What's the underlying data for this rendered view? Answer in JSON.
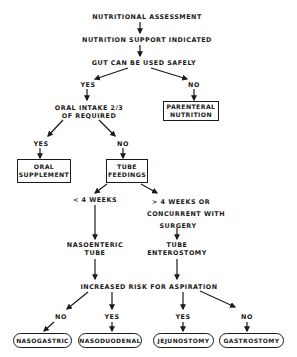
{
  "diagram": {
    "type": "flowchart",
    "title": "Nutritional Assessment",
    "nodes": {
      "assessment": "NUTRITIONAL ASSESSMENT",
      "support": "NUTRITION SUPPORT INDICATED",
      "gut": "GUT CAN BE USED SAFELY",
      "gut_yes": "YES",
      "gut_no": "NO",
      "oral_intake_line1": "ORAL INTAKE 2/3",
      "oral_intake_line2": "OF REQUIRED",
      "parenteral_line1": "PARENTERAL",
      "parenteral_line2": "NUTRITION",
      "oral_yes": "YES",
      "oral_no": "NO",
      "oral_supplement_line1": "ORAL",
      "oral_supplement_line2": "SUPPLEMENT",
      "tube_feedings_line1": "TUBE",
      "tube_feedings_line2": "FEEDINGS",
      "short_term": "< 4 WEEKS",
      "long_term_line1": "> 4 WEEKS OR",
      "long_term_line2": "CONCURRENT WITH",
      "long_term_line3": "SURGERY",
      "nasoenteric_line1": "NASOENTERIC",
      "nasoenteric_line2": "TUBE",
      "enterostomy_line1": "TUBE",
      "enterostomy_line2": "ENTEROSTOMY",
      "aspiration": "INCREASED RISK FOR ASPIRATION",
      "asp_no_left": "NO",
      "asp_yes_left": "YES",
      "asp_yes_right": "YES",
      "asp_no_right": "NO",
      "nasogastric": "NASOGASTRIC",
      "nasoduodenal": "NASODUODENAL",
      "jejunostomy": "JEJUNOSTOMY",
      "gastrostomy": "GASTROSTOMY"
    },
    "edges": [
      [
        "assessment",
        "support"
      ],
      [
        "support",
        "gut"
      ],
      [
        "gut",
        "gut_yes"
      ],
      [
        "gut",
        "gut_no"
      ],
      [
        "gut_yes",
        "oral_intake"
      ],
      [
        "gut_no",
        "parenteral"
      ],
      [
        "oral_intake",
        "oral_yes"
      ],
      [
        "oral_intake",
        "oral_no"
      ],
      [
        "oral_yes",
        "oral_supplement"
      ],
      [
        "oral_no",
        "tube_feedings"
      ],
      [
        "tube_feedings",
        "short_term"
      ],
      [
        "tube_feedings",
        "long_term"
      ],
      [
        "short_term",
        "nasoenteric"
      ],
      [
        "long_term",
        "enterostomy"
      ],
      [
        "nasoenteric",
        "aspiration"
      ],
      [
        "enterostomy",
        "aspiration"
      ],
      [
        "aspiration",
        "asp_no_left"
      ],
      [
        "aspiration",
        "asp_yes_left"
      ],
      [
        "aspiration",
        "asp_yes_right"
      ],
      [
        "aspiration",
        "asp_no_right"
      ],
      [
        "asp_no_left",
        "nasogastric"
      ],
      [
        "asp_yes_left",
        "nasoduodenal"
      ],
      [
        "asp_yes_right",
        "jejunostomy"
      ],
      [
        "asp_no_right",
        "gastrostomy"
      ]
    ]
  }
}
